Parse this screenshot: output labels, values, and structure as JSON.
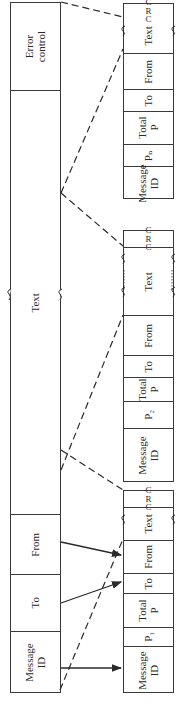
{
  "diagram": {
    "original_message": {
      "fields": [
        {
          "label": "Error\ncontrol"
        },
        {
          "label": "Text"
        },
        {
          "label": "From"
        },
        {
          "label": "To"
        },
        {
          "label": "Message\nID"
        }
      ]
    },
    "packets": [
      {
        "name": "packet-n",
        "fields": [
          {
            "label": "C\nR\nC"
          },
          {
            "label": "Text"
          },
          {
            "label": "From"
          },
          {
            "label": "To"
          },
          {
            "label": "Total\nP"
          },
          {
            "label": "Pₙ"
          },
          {
            "label": "Message\nID"
          }
        ]
      },
      {
        "name": "packet-2",
        "fields": [
          {
            "label": "C\nR\nC"
          },
          {
            "label": "Text"
          },
          {
            "label": "From"
          },
          {
            "label": "To"
          },
          {
            "label": "Total\nP"
          },
          {
            "label": "P₂"
          },
          {
            "label": "Message\nID"
          }
        ]
      },
      {
        "name": "packet-1",
        "fields": [
          {
            "label": "C\nR\nC"
          },
          {
            "label": "Text"
          },
          {
            "label": "From"
          },
          {
            "label": "To"
          },
          {
            "label": "Total\nP"
          },
          {
            "label": "P₁"
          },
          {
            "label": "Message\nID"
          }
        ]
      }
    ],
    "colors": {
      "line": "#3a3a3a",
      "background": "#ffffff"
    }
  }
}
